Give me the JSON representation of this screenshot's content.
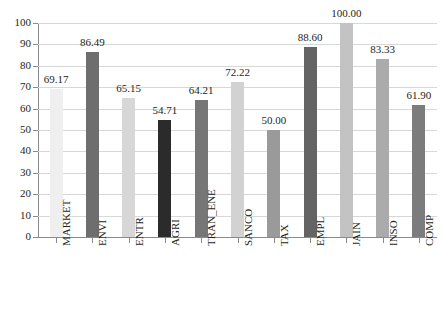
{
  "chart_data": {
    "type": "bar",
    "title": "",
    "subtitle": "",
    "xlabel": "",
    "ylabel": "",
    "ylim": [
      0,
      100
    ],
    "ytick_step": 10,
    "yticks": [
      "0",
      "10",
      "20",
      "30",
      "40",
      "50",
      "60",
      "70",
      "80",
      "90",
      "100"
    ],
    "grid": true,
    "legend": "none",
    "orientation": "vertical",
    "xtick_rotation": -90,
    "categories": [
      "MARKET",
      "ENVI",
      "ENTR",
      "AGRI",
      "TRAN_ENE",
      "SANCO",
      "TAX",
      "EMPL",
      "JAIN",
      "INSO",
      "COMP"
    ],
    "values": [
      69.17,
      86.49,
      65.15,
      54.71,
      64.21,
      72.22,
      50.0,
      88.6,
      100.0,
      83.33,
      61.9
    ],
    "value_labels": [
      "69.17",
      "86.49",
      "65.15",
      "54.71",
      "64.21",
      "72.22",
      "50.00",
      "88.60",
      "100.00",
      "83.33",
      "61.90"
    ],
    "bar_colors": [
      "#efefef",
      "#6e6e6e",
      "#d7d7d7",
      "#2b2b2b",
      "#767676",
      "#d2d2d2",
      "#9a9a9a",
      "#646464",
      "#c3c3c3",
      "#ababab",
      "#7c7c7c"
    ],
    "axis_color": "#8a8a8a",
    "gridline_color": "#d8d8d8",
    "text_color": "#231f20",
    "background_color": "#ffffff"
  }
}
